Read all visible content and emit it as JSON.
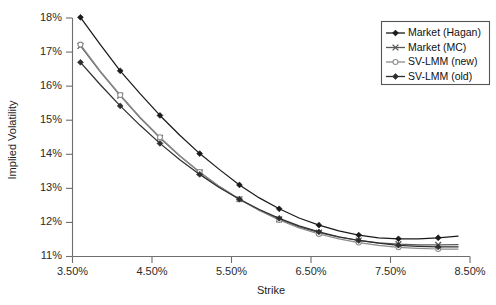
{
  "chart_data": {
    "type": "line",
    "title": "",
    "xlabel": "Strike",
    "ylabel": "Implied Volatility",
    "xlim": [
      3.5,
      8.5
    ],
    "ylim": [
      11,
      18
    ],
    "xticks": [
      "3.50%",
      "4.50%",
      "5.50%",
      "6.50%",
      "7.50%",
      "8.50%"
    ],
    "xtick_values": [
      3.5,
      4.5,
      5.5,
      6.5,
      7.5,
      8.5
    ],
    "yticks": [
      "11%",
      "12%",
      "13%",
      "14%",
      "15%",
      "16%",
      "17%",
      "18%"
    ],
    "ytick_values": [
      11,
      12,
      13,
      14,
      15,
      16,
      17,
      18
    ],
    "grid": false,
    "legend_position": "top-right",
    "x": [
      3.6,
      3.85,
      4.1,
      4.35,
      4.6,
      4.85,
      5.1,
      5.35,
      5.6,
      5.85,
      6.1,
      6.35,
      6.6,
      6.85,
      7.1,
      7.35,
      7.6,
      7.85,
      8.1,
      8.35
    ],
    "series": [
      {
        "name": "Market (Hagan)",
        "marker": "filled-diamond",
        "color": "#1a1a1a",
        "values": [
          18.02,
          17.22,
          16.45,
          15.78,
          15.14,
          14.56,
          14.02,
          13.55,
          13.1,
          12.72,
          12.4,
          12.13,
          11.92,
          11.75,
          11.63,
          11.55,
          11.52,
          11.52,
          11.55,
          11.6
        ]
      },
      {
        "name": "Market (MC)",
        "marker": "x-cross",
        "color": "#5a5a5a",
        "values": [
          17.18,
          16.42,
          15.72,
          15.07,
          14.48,
          13.95,
          13.47,
          13.05,
          12.68,
          12.36,
          12.09,
          11.87,
          11.7,
          11.57,
          11.47,
          11.4,
          11.36,
          11.34,
          11.34,
          11.35
        ]
      },
      {
        "name": "SV-LMM (new)",
        "marker": "open-circle",
        "color": "#8c8c8c",
        "values": [
          17.22,
          16.44,
          15.74,
          15.09,
          14.5,
          13.96,
          13.48,
          13.05,
          12.68,
          12.35,
          12.07,
          11.84,
          11.66,
          11.52,
          11.41,
          11.33,
          11.27,
          11.24,
          11.22,
          11.22
        ]
      },
      {
        "name": "SV-LMM (old)",
        "marker": "filled-diamond",
        "color": "#2e2e2e",
        "values": [
          16.7,
          16.04,
          15.42,
          14.85,
          14.32,
          13.84,
          13.41,
          13.02,
          12.68,
          12.38,
          12.12,
          11.9,
          11.72,
          11.58,
          11.47,
          11.39,
          11.33,
          11.3,
          11.28,
          11.28
        ]
      }
    ]
  },
  "legend": {
    "items": [
      {
        "label": "Market (Hagan)"
      },
      {
        "label": "Market (MC)"
      },
      {
        "label": "SV-LMM (new)"
      },
      {
        "label": "SV-LMM (old)"
      }
    ]
  }
}
